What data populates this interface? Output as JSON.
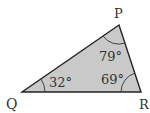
{
  "diagram": {
    "fill_color": "#c9c9c9",
    "stroke_color": "#222222",
    "vertices": [
      {
        "label": "P",
        "x": 119,
        "y": 25
      },
      {
        "label": "Q",
        "x": 22,
        "y": 92
      },
      {
        "label": "R",
        "x": 141,
        "y": 92
      }
    ],
    "angles": [
      {
        "vertex": "P",
        "value": "79°"
      },
      {
        "vertex": "Q",
        "value": "32°"
      },
      {
        "vertex": "R",
        "value": "69°"
      }
    ]
  }
}
